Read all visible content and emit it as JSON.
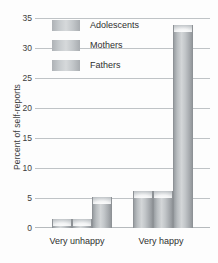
{
  "chart_data": {
    "type": "bar",
    "title": "",
    "xlabel": "",
    "ylabel": "Percent of self-reports",
    "categories": [
      "Very unhappy",
      "Very happy"
    ],
    "series": [
      {
        "name": "Adolescents",
        "values": [
          1.5,
          6.2
        ]
      },
      {
        "name": "Mothers",
        "values": [
          1.5,
          6.2
        ]
      },
      {
        "name": "Fathers",
        "values": [
          5.2,
          34.0
        ]
      }
    ],
    "ylim": [
      0,
      35
    ],
    "yticks": [
      0,
      5,
      10,
      15,
      20,
      25,
      30,
      35
    ],
    "ytick_labels": [
      "0",
      "5",
      "10",
      "15",
      "20",
      "25",
      "30",
      "35"
    ],
    "grid": true,
    "legend_position": "top-left-inside",
    "bar_fill": "#c2c6c9",
    "gridline_color": "#bfc3c6"
  },
  "legend": {
    "items": [
      {
        "label": "Adolescents"
      },
      {
        "label": "Mothers"
      },
      {
        "label": "Fathers"
      }
    ]
  },
  "axes": {
    "y_title": "Percent of self-reports",
    "y_ticks": [
      "35",
      "30",
      "25",
      "20",
      "15",
      "10",
      "5",
      "0"
    ],
    "x_ticks": [
      "Very unhappy",
      "Very happy"
    ]
  }
}
